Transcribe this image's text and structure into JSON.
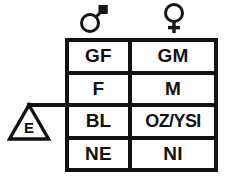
{
  "figure": {
    "type": "pedigree-generation-table",
    "background_color": "#ffffff",
    "line_color": "#111111"
  },
  "column_headers": [
    {
      "id": "male",
      "icon": "mars-male-symbol",
      "glyph": "♂",
      "label": "male"
    },
    {
      "id": "female",
      "icon": "venus-female-symbol",
      "glyph": "♀",
      "label": "female"
    }
  ],
  "row_marker": {
    "icon": "triangle-marker-icon",
    "label": "E",
    "connector": "horizontal-line-to-table",
    "points_to_row_index": 2
  },
  "table": {
    "columns": [
      "male",
      "female"
    ],
    "rows": [
      {
        "index": 0,
        "male": "GF",
        "female": "GM"
      },
      {
        "index": 1,
        "male": "F",
        "female": "M"
      },
      {
        "index": 2,
        "male": "BL",
        "female": "OZ/YSI"
      },
      {
        "index": 3,
        "male": "NE",
        "female": "NI"
      }
    ]
  }
}
